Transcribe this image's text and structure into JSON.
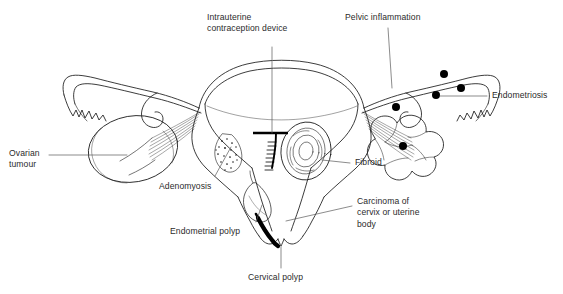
{
  "figure": {
    "kind": "anatomical-line-diagram",
    "background_color": "#ffffff",
    "line_color": "#1a1a1a",
    "text_color": "#2b2b2b",
    "marker_color": "#000000"
  },
  "labels": {
    "iud": "Intrauterine\ncontraception device",
    "pelvic_inflammation": "Pelvic inflammation",
    "endometriosis": "Endometriosis",
    "ovarian_tumour": "Ovarian\ntumour",
    "adenomyosis": "Adenomyosis",
    "fibroid": "Fibroid",
    "endometrial_polyp": "Endometrial polyp",
    "carcinoma": "Carcinoma of\ncervix or uterine\nbody",
    "cervical_polyp": "Cervical polyp"
  },
  "markers": {
    "endometriosis_dot_count": 5,
    "endometriosis_dot_radius": 4.0
  }
}
